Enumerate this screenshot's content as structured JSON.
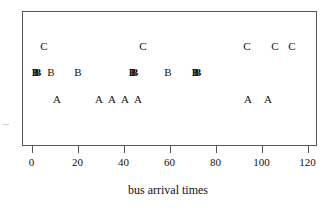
{
  "chart_data": {
    "type": "scatter",
    "title": "",
    "subtitle": "",
    "xlabel": "bus arrival times",
    "ylabel": "",
    "xlim": [
      -3,
      126
    ],
    "xticks": [
      0,
      20,
      40,
      60,
      80,
      100,
      120
    ],
    "xtick_labels": [
      "0",
      "20",
      "40",
      "60",
      "80",
      "100",
      "120"
    ],
    "grid": false,
    "legend": "none",
    "series": [
      {
        "name": "C",
        "label": "C",
        "row": 0,
        "y_pixel": 46,
        "values": [
          5.4,
          48.5,
          94,
          106,
          113
        ],
        "points": [
          {
            "label": "C",
            "x": 5.4,
            "px": 44,
            "overlap": false
          },
          {
            "label": "C",
            "x": 48.5,
            "px": 143,
            "overlap": false
          },
          {
            "label": "C",
            "x": 94,
            "px": 247,
            "overlap": false
          },
          {
            "label": "C",
            "x": 106,
            "px": 275,
            "overlap": false
          },
          {
            "label": "C",
            "x": 113,
            "px": 292,
            "overlap": false
          }
        ]
      },
      {
        "name": "B",
        "label": "B",
        "row": 1,
        "y_pixel": 72,
        "values": [
          0.5,
          2.5,
          8.5,
          20,
          42,
          44,
          59,
          69,
          71
        ],
        "points": [
          {
            "label": "BB",
            "x": 1.5,
            "px": 34,
            "overlap": true
          },
          {
            "label": "B",
            "x": 8.5,
            "px": 51,
            "overlap": false
          },
          {
            "label": "B",
            "x": 20,
            "px": 78,
            "overlap": false
          },
          {
            "label": "BB",
            "x": 43,
            "px": 131,
            "overlap": true
          },
          {
            "label": "B",
            "x": 59,
            "px": 168,
            "overlap": false
          },
          {
            "label": "BB",
            "x": 70,
            "px": 194,
            "overlap": true
          }
        ]
      },
      {
        "name": "A",
        "label": "A",
        "row": 2,
        "y_pixel": 99,
        "values": [
          11,
          29.5,
          35,
          40.5,
          46,
          94,
          103
        ],
        "points": [
          {
            "label": "A",
            "x": 11,
            "px": 57,
            "overlap": false
          },
          {
            "label": "A",
            "x": 29.5,
            "px": 99,
            "overlap": false
          },
          {
            "label": "A",
            "x": 35,
            "px": 112,
            "overlap": false
          },
          {
            "label": "A",
            "x": 40.5,
            "px": 125,
            "overlap": false
          },
          {
            "label": "A",
            "x": 46,
            "px": 138,
            "overlap": false
          },
          {
            "label": "A",
            "x": 94,
            "px": 248,
            "overlap": false
          },
          {
            "label": "A",
            "x": 103,
            "px": 268,
            "overlap": false
          }
        ]
      }
    ]
  },
  "colors": {
    "background": "#ffffff",
    "frame": "#555555",
    "text": "#111111"
  }
}
